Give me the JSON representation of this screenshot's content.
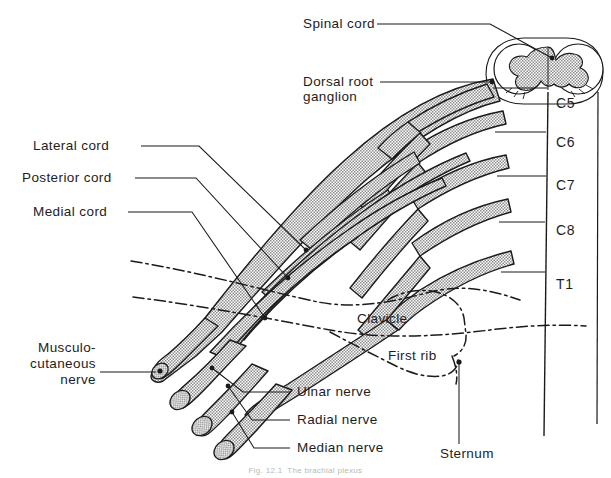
{
  "figure": {
    "background_color": "#ffffff",
    "ink_color": "#1a1a1a",
    "nerve_fill_color": "#c9c9c9",
    "caption": "Fig. 12.1  The brachial plexus"
  },
  "labels": {
    "spinal_cord": "Spinal cord",
    "dorsal_root_ganglion_line1": "Dorsal root",
    "dorsal_root_ganglion_line2": "ganglion",
    "lateral_cord": "Lateral cord",
    "posterior_cord": "Posterior cord",
    "medial_cord": "Medial cord",
    "musculocutaneous_line1": "Musculo-",
    "musculocutaneous_line2": "cutaneous",
    "musculocutaneous_line3": "nerve",
    "ulnar_nerve": "Ulnar nerve",
    "radial_nerve": "Radial nerve",
    "median_nerve": "Median nerve",
    "clavicle": "Clavicle",
    "first_rib": "First rib",
    "sternum": "Sternum"
  },
  "spinal_segments": [
    {
      "id": "C5",
      "label": "C5"
    },
    {
      "id": "C6",
      "label": "C6"
    },
    {
      "id": "C7",
      "label": "C7"
    },
    {
      "id": "C8",
      "label": "C8"
    },
    {
      "id": "T1",
      "label": "T1"
    }
  ]
}
